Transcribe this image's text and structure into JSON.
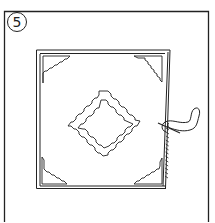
{
  "diagram": {
    "step": {
      "number": "5",
      "shape": "circle"
    },
    "stroke_color": "#222222",
    "background": "#ffffff",
    "elements": {
      "outer_frame": "panel border",
      "fabric_square": "square fabric piece",
      "corner_triangles": [
        "top-left",
        "top-right",
        "bottom-left",
        "bottom-right"
      ],
      "center_motif": "double stepped diamond outline",
      "right_edge": "folded edge with whip stitching",
      "needle_thread": "needle and thread loop sewing the right edge"
    }
  }
}
